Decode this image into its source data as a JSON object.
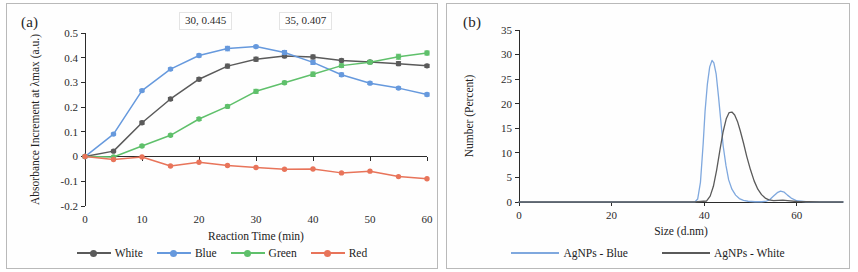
{
  "figure": {
    "panels": [
      {
        "tag": "(a)"
      },
      {
        "tag": "(b)"
      }
    ]
  },
  "panel_a": {
    "tag": "(a)",
    "annotations": [
      {
        "name": "blue-peak",
        "text": "30, 0.445"
      },
      {
        "name": "white-peak",
        "text": "35, 0.407"
      }
    ],
    "legend": [
      {
        "label": "White",
        "color": "#5a5a5a"
      },
      {
        "label": "Blue",
        "color": "#6699dd"
      },
      {
        "label": "Green",
        "color": "#5fc06b"
      },
      {
        "label": "Red",
        "color": "#e8745a"
      }
    ]
  },
  "panel_b": {
    "tag": "(b)",
    "legend": [
      {
        "label": "AgNPs - Blue",
        "color": "#7fa8de"
      },
      {
        "label": "AgNPs - White",
        "color": "#5a5a5a"
      }
    ]
  },
  "chart_data": [
    {
      "type": "line",
      "panel": "(a)",
      "title": "",
      "xlabel": "Reaction Time (min)",
      "ylabel": "Absorbance Increment at λmax (a.u.)",
      "xlim": [
        0,
        60
      ],
      "ylim": [
        -0.2,
        0.5
      ],
      "xticks": [
        0,
        10,
        20,
        30,
        40,
        50,
        60
      ],
      "xtick_labels": [
        "0",
        "10",
        "20",
        "30",
        "40",
        "50",
        "60"
      ],
      "yticks": [
        -0.2,
        -0.1,
        0,
        0.1,
        0.2,
        0.3,
        0.4,
        0.5
      ],
      "ytick_labels": [
        "-0.2",
        "-0.1",
        "0",
        "0.1",
        "0.2",
        "0.3",
        "0.4",
        "0.5"
      ],
      "grid": false,
      "legend_position": "bottom",
      "x": [
        0,
        5,
        10,
        15,
        20,
        25,
        30,
        35,
        40,
        45,
        50,
        55,
        60
      ],
      "series": [
        {
          "name": "White",
          "color": "#5a5a5a",
          "marker": "circle",
          "values": [
            0.0,
            0.022,
            0.137,
            0.233,
            0.313,
            0.366,
            0.394,
            0.407,
            0.403,
            0.389,
            0.383,
            0.376,
            0.367
          ],
          "errors": [
            0.0,
            0.004,
            0.006,
            0.006,
            0.006,
            0.008,
            0.008,
            0.007,
            0.008,
            0.006,
            0.006,
            0.008,
            0.006
          ]
        },
        {
          "name": "Blue",
          "color": "#6699dd",
          "marker": "circle",
          "values": [
            0.0,
            0.091,
            0.267,
            0.354,
            0.409,
            0.437,
            0.445,
            0.421,
            0.381,
            0.331,
            0.297,
            0.277,
            0.251
          ],
          "errors": [
            0.0,
            0.004,
            0.005,
            0.005,
            0.006,
            0.009,
            0.005,
            0.008,
            0.008,
            0.007,
            0.005,
            0.005,
            0.006
          ]
        },
        {
          "name": "Green",
          "color": "#5fc06b",
          "marker": "circle",
          "values": [
            0.0,
            -0.002,
            0.043,
            0.086,
            0.152,
            0.203,
            0.264,
            0.299,
            0.333,
            0.368,
            0.382,
            0.404,
            0.419
          ],
          "errors": [
            0.0,
            0.003,
            0.004,
            0.005,
            0.006,
            0.006,
            0.008,
            0.006,
            0.009,
            0.007,
            0.007,
            0.01,
            0.008
          ]
        },
        {
          "name": "Red",
          "color": "#e8745a",
          "marker": "circle",
          "values": [
            0.0,
            -0.012,
            -0.002,
            -0.038,
            -0.023,
            -0.036,
            -0.044,
            -0.051,
            -0.05,
            -0.066,
            -0.059,
            -0.081,
            -0.09
          ],
          "errors": [
            0.0,
            0.0,
            0.0,
            0.0,
            0.0,
            0.0,
            0.0,
            0.0,
            0.0,
            0.0,
            0.0,
            0.0,
            0.0
          ]
        }
      ],
      "annotations": [
        {
          "text": "30, 0.445",
          "x": 30,
          "y": 0.445
        },
        {
          "text": "35, 0.407",
          "x": 35,
          "y": 0.407
        }
      ]
    },
    {
      "type": "line",
      "panel": "(b)",
      "title": "",
      "xlabel": "Size (d.nm)",
      "ylabel": "Number (Percent)",
      "xlim": [
        0,
        70
      ],
      "ylim": [
        0,
        35
      ],
      "xticks": [
        0,
        20,
        40,
        60
      ],
      "xtick_labels": [
        "0",
        "20",
        "40",
        "60"
      ],
      "yticks": [
        0,
        5,
        10,
        15,
        20,
        25,
        30,
        35
      ],
      "ytick_labels": [
        "0",
        "5",
        "10",
        "15",
        "20",
        "25",
        "30",
        "35"
      ],
      "grid": false,
      "legend_position": "bottom",
      "series": [
        {
          "name": "AgNPs - Blue",
          "color": "#7fa8de",
          "x": [
            0,
            20,
            34,
            37,
            38,
            38.6,
            39.2,
            39.8,
            40.2,
            40.7,
            41.2,
            41.7,
            42.1,
            42.6,
            43.1,
            43.6,
            44.1,
            44.7,
            45.3,
            46,
            46.8,
            47.6,
            48.5,
            49.5,
            51,
            52.5,
            53.5,
            54.2,
            55,
            55.8,
            56.5,
            57.3,
            58,
            58.8,
            60,
            62,
            65,
            70
          ],
          "values": [
            0,
            0,
            0,
            0,
            0,
            0.6,
            4.0,
            12.0,
            18.5,
            24.0,
            27.5,
            28.8,
            28.3,
            26.0,
            21.5,
            16.5,
            11.5,
            7.5,
            4.5,
            2.6,
            1.4,
            0.7,
            0.35,
            0.15,
            0.05,
            0.05,
            0.2,
            0.5,
            1.2,
            1.9,
            2.2,
            2.0,
            1.4,
            0.8,
            0.25,
            0.05,
            0,
            0
          ],
          "peak": {
            "x": 42,
            "y": 28.8
          },
          "secondary_peak": {
            "x": 56.5,
            "y": 2.2
          }
        },
        {
          "name": "AgNPs - White",
          "color": "#5a5a5a",
          "x": [
            0,
            20,
            38,
            40.5,
            41.3,
            42,
            42.7,
            43.4,
            44.1,
            44.8,
            45.4,
            46,
            46.6,
            47.2,
            47.8,
            48.5,
            49.2,
            50,
            50.8,
            51.6,
            52.4,
            53.2,
            54,
            55,
            56,
            57,
            58,
            60,
            65,
            70
          ],
          "values": [
            0,
            0,
            0,
            0.2,
            1.2,
            3.2,
            6.5,
            10.5,
            14.3,
            17.0,
            18.2,
            18.3,
            17.7,
            16.4,
            14.5,
            12.0,
            9.3,
            6.6,
            4.3,
            2.6,
            1.5,
            0.8,
            0.45,
            0.3,
            0.35,
            0.4,
            0.3,
            0.1,
            0,
            0
          ],
          "peak": {
            "x": 46,
            "y": 18.3
          }
        }
      ]
    }
  ]
}
